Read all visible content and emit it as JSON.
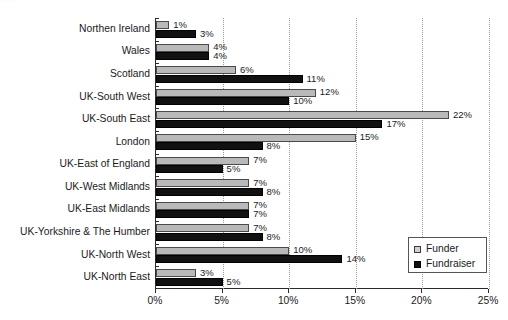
{
  "chart_data": {
    "type": "bar",
    "orientation": "horizontal",
    "title": "",
    "subtitle": "",
    "xlabel": "",
    "ylabel": "",
    "xlim": [
      0,
      25
    ],
    "xticks": [
      "0%",
      "5%",
      "10%",
      "15%",
      "20%",
      "25%"
    ],
    "xtick_values": [
      0,
      5,
      10,
      15,
      20,
      25
    ],
    "grid": true,
    "grid_axis": "x",
    "legend_position": "bottom-right",
    "value_label_suffix": "%",
    "categories": [
      "Northen Ireland",
      "Wales",
      "Scotland",
      "UK-South West",
      "UK-South East",
      "London",
      "UK-East of England",
      "UK-West Midlands",
      "UK-East Midlands",
      "UK-Yorkshire & The Humber",
      "UK-North West",
      "UK-North East"
    ],
    "series": [
      {
        "name": "Funder",
        "color": "#b9b9b9",
        "values": [
          1,
          4,
          6,
          12,
          22,
          15,
          7,
          7,
          7,
          7,
          10,
          3
        ],
        "labels": [
          "1%",
          "4%",
          "6%",
          "12%",
          "22%",
          "15%",
          "7%",
          "7%",
          "7%",
          "7%",
          "10%",
          "3%"
        ]
      },
      {
        "name": "Fundraiser",
        "color": "#111111",
        "values": [
          3,
          4,
          11,
          10,
          17,
          8,
          5,
          8,
          7,
          8,
          14,
          5
        ],
        "labels": [
          "3%",
          "4%",
          "11%",
          "10%",
          "17%",
          "8%",
          "5%",
          "8%",
          "7%",
          "8%",
          "14%",
          "5%"
        ]
      }
    ]
  },
  "legend": {
    "items": [
      {
        "label": "Funder",
        "swatch": "funder-swatch-icon"
      },
      {
        "label": "Fundraiser",
        "swatch": "fundraiser-swatch-icon"
      }
    ]
  },
  "artifact": {
    "text": "··  ···      ·"
  }
}
